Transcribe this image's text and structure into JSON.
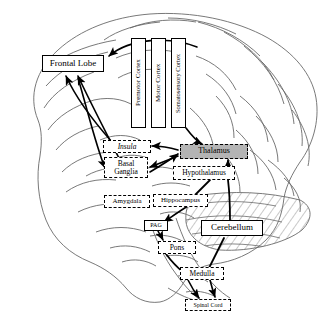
{
  "diagram": {
    "type": "anatomical-flow-diagram",
    "background_color": "#ffffff",
    "outline_color": "#555555",
    "highlight_fill": "#b4b4b4"
  },
  "regions": [
    {
      "id": "frontal-lobe",
      "label": "Frontal Lobe",
      "style": "solid",
      "x": 42,
      "y": 55,
      "w": 62,
      "h": 17,
      "orient": "h",
      "size": "t9"
    },
    {
      "id": "premotor-cortex",
      "label": "Premotor Cortex",
      "style": "solid",
      "x": 131,
      "y": 38,
      "w": 15,
      "h": 90,
      "orient": "v",
      "size": "t7"
    },
    {
      "id": "motor-cortex",
      "label": "Motor Cortex",
      "style": "solid",
      "x": 151,
      "y": 38,
      "w": 15,
      "h": 90,
      "orient": "v",
      "size": "t7"
    },
    {
      "id": "somatosensory-cortex",
      "label": "Somatosensory Cortex",
      "style": "solid",
      "x": 171,
      "y": 38,
      "w": 15,
      "h": 90,
      "orient": "v",
      "size": "t65"
    },
    {
      "id": "insula",
      "label": "Insula",
      "style": "dashed-ital",
      "x": 103,
      "y": 140,
      "w": 48,
      "h": 13,
      "orient": "h",
      "size": "t75"
    },
    {
      "id": "thalamus",
      "label": "Thalamus",
      "style": "dashed-gray",
      "x": 180,
      "y": 144,
      "w": 68,
      "h": 15,
      "orient": "h",
      "size": "t8"
    },
    {
      "id": "basal-ganglia",
      "label": "Basal\nGanglia",
      "style": "dashed",
      "x": 104,
      "y": 157,
      "w": 44,
      "h": 21,
      "orient": "h",
      "size": "t75"
    },
    {
      "id": "hypothalamus",
      "label": "Hypothalamus",
      "style": "dashed",
      "x": 173,
      "y": 166,
      "w": 62,
      "h": 14,
      "orient": "h",
      "size": "t75"
    },
    {
      "id": "amygdala",
      "label": "Amygdala",
      "style": "dashed",
      "x": 104,
      "y": 195,
      "w": 46,
      "h": 13,
      "orient": "h",
      "size": "t7"
    },
    {
      "id": "hippocampus",
      "label": "Hippocampus",
      "style": "dashed",
      "x": 153,
      "y": 194,
      "w": 55,
      "h": 13,
      "orient": "h",
      "size": "t7"
    },
    {
      "id": "pag",
      "label": "PAG",
      "style": "solid",
      "x": 144,
      "y": 220,
      "w": 24,
      "h": 11,
      "orient": "h",
      "size": "t6"
    },
    {
      "id": "cerebellum",
      "label": "Cerebellum",
      "style": "solid",
      "x": 201,
      "y": 220,
      "w": 62,
      "h": 16,
      "orient": "h",
      "size": "t9"
    },
    {
      "id": "pons",
      "label": "Pons",
      "style": "dashed",
      "x": 158,
      "y": 241,
      "w": 38,
      "h": 13,
      "orient": "h",
      "size": "t75"
    },
    {
      "id": "medulla",
      "label": "Medulla",
      "style": "dashed",
      "x": 180,
      "y": 267,
      "w": 44,
      "h": 13,
      "orient": "h",
      "size": "t75"
    },
    {
      "id": "spinal-cord",
      "label": "Spinal Cord",
      "style": "dashed",
      "x": 185,
      "y": 299,
      "w": 46,
      "h": 12,
      "orient": "h",
      "size": "t6"
    }
  ],
  "connections": [
    {
      "from": "premotor-cortex",
      "to": "frontal-lobe",
      "arrow": "single"
    },
    {
      "from": "insula",
      "to": "frontal-lobe",
      "arrow": "single"
    },
    {
      "from": "thalamus",
      "to": "frontal-lobe",
      "arrow": "single"
    },
    {
      "from": "frontal-lobe",
      "to": "basal-ganglia",
      "arrow": "single"
    },
    {
      "from": "thalamus",
      "to": "insula",
      "arrow": "single"
    },
    {
      "from": "thalamus",
      "to": "basal-ganglia",
      "arrow": "double"
    },
    {
      "from": "somatosensory-cortex",
      "to": "thalamus",
      "arrow": "single"
    },
    {
      "from": "hypothalamus",
      "to": "thalamus",
      "arrow": "single"
    },
    {
      "from": "hypothalamus",
      "to": "hippocampus",
      "arrow": "line"
    },
    {
      "from": "hypothalamus",
      "to": "cerebellum",
      "arrow": "line"
    },
    {
      "from": "hippocampus",
      "to": "pag",
      "arrow": "single"
    },
    {
      "from": "pag",
      "to": "pons",
      "arrow": "single"
    },
    {
      "from": "pons",
      "to": "medulla",
      "arrow": "line"
    },
    {
      "from": "cerebellum",
      "to": "medulla",
      "arrow": "line"
    },
    {
      "from": "medulla",
      "to": "spinal-cord",
      "arrow": "double"
    }
  ]
}
